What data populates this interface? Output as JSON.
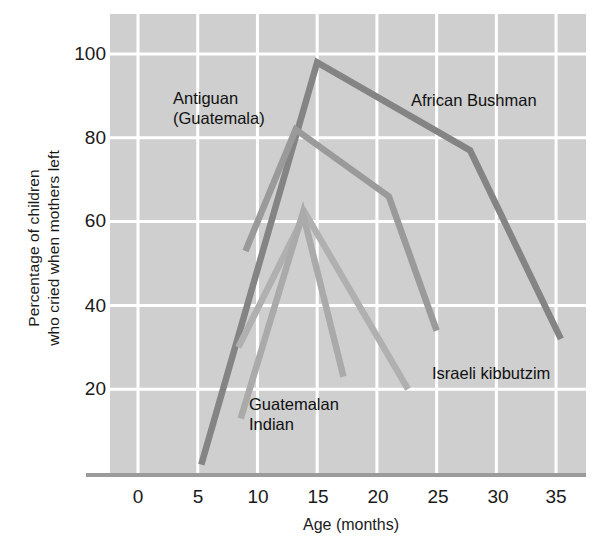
{
  "chart_data": {
    "type": "line",
    "title": "",
    "xlabel": "Age (months)",
    "ylabel": "Percentage of children who cried when mothers left",
    "ylabel_line1": "Percentage of children",
    "ylabel_line2": "who cried when mothers left",
    "xlim": [
      -2.5,
      35.5
    ],
    "ylim": [
      0,
      105
    ],
    "xticks": [
      0,
      5,
      10,
      15,
      20,
      25,
      30,
      35
    ],
    "xtick_labels": [
      "0",
      "5",
      "10",
      "15",
      "20",
      "25",
      "30",
      "35"
    ],
    "yticks": [
      20,
      40,
      60,
      80,
      100
    ],
    "ytick_labels": [
      "20",
      "40",
      "60",
      "80",
      "100"
    ],
    "grid": true,
    "grid_color": "#ffffff",
    "plot_background": "#cfcfcf",
    "legend_position": "inline-annotations",
    "series": [
      {
        "name": "African Bushman",
        "color": "#848484",
        "label_x": 24.5,
        "label_y": 88,
        "points": [
          [
            5.3,
            2
          ],
          [
            15.0,
            98
          ],
          [
            27.8,
            77
          ],
          [
            35.4,
            32
          ]
        ]
      },
      {
        "name": "Antiguan (Guatemala)",
        "color": "#9a9a9a",
        "label_x": 11.5,
        "label_y": 93,
        "points": [
          [
            9.0,
            53
          ],
          [
            13.2,
            82
          ],
          [
            21.0,
            66
          ],
          [
            25.0,
            34
          ]
        ]
      },
      {
        "name": "Israeli kibbutzim",
        "color": "#b0b0b0",
        "label_x": 25.5,
        "label_y": 25,
        "points": [
          [
            8.4,
            30
          ],
          [
            14.0,
            62
          ],
          [
            22.6,
            20
          ]
        ]
      },
      {
        "name": "Guatemalan Indian",
        "color": "#aaaaaa",
        "label_x": 10.8,
        "label_y": 13,
        "points": [
          [
            8.6,
            13
          ],
          [
            13.8,
            62
          ],
          [
            17.2,
            23
          ]
        ]
      }
    ],
    "annotations": [
      {
        "text": "Antiguan",
        "x": 11.5,
        "y": 95
      },
      {
        "text": "(Guatemala)",
        "x": 11.5,
        "y": 87
      },
      {
        "text": "African Bushman",
        "x": 24.0,
        "y": 88
      },
      {
        "text": "Israeli kibbutzim",
        "x": 25.0,
        "y": 25
      },
      {
        "text": "Guatemalan",
        "x": 10.5,
        "y": 14
      },
      {
        "text": "Indian",
        "x": 10.5,
        "y": 6
      }
    ]
  },
  "labels": {
    "antiguan_line1": "Antiguan",
    "antiguan_line2": "(Guatemala)",
    "african_bushman": "African Bushman",
    "israeli_kibbutzim": "Israeli kibbutzim",
    "guatemalan_line1": "Guatemalan",
    "guatemalan_line2": "Indian",
    "x_axis_title": "Age (months)",
    "y_axis_title_line1": "Percentage of children",
    "y_axis_title_line2": "who cried when mothers left"
  },
  "ticks": {
    "y": [
      "100",
      "80",
      "60",
      "40",
      "20"
    ],
    "x": [
      "0",
      "5",
      "10",
      "15",
      "20",
      "25",
      "30",
      "35"
    ]
  }
}
